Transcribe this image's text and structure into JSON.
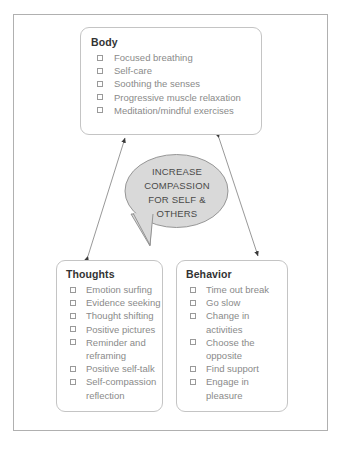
{
  "diagram": {
    "center_bubble": {
      "text": "INCREASE\nCOMPASSION\nFOR SELF &\nOTHERS",
      "fill_color": "#d9d9d9",
      "stroke_color": "#8c8c8c"
    },
    "cards": [
      {
        "id": "body",
        "title": "Body",
        "items": [
          "Focused breathing",
          "Self-care",
          "Soothing the senses",
          "Progressive muscle relaxation",
          "Meditation/mindful exercises"
        ]
      },
      {
        "id": "thoughts",
        "title": "Thoughts",
        "items": [
          "Emotion surfing",
          "Evidence seeking",
          "Thought shifting",
          "Positive pictures",
          "Reminder and\nreframing",
          "Positive self-talk",
          "Self-compassion\nreflection"
        ]
      },
      {
        "id": "behavior",
        "title": "Behavior",
        "items": [
          "Time out break",
          "Go slow",
          "Change in\nactivities",
          "Choose the\nopposite",
          "Find support",
          "Engage in\npleasure"
        ]
      }
    ],
    "connectors": [
      {
        "name": "thoughts-to-body",
        "double_headed": true
      },
      {
        "name": "body-to-behavior",
        "double_headed": true
      }
    ],
    "colors": {
      "frame_border": "#b0b0b0",
      "card_border": "#c4c4c4",
      "title_text": "#333333",
      "item_text": "#8a8a8a",
      "connector": "#8c8c8c"
    }
  }
}
